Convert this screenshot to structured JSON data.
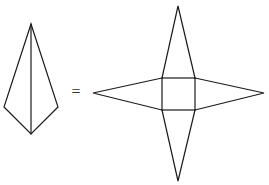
{
  "diagram": {
    "type": "pyramid-net-equivalence",
    "colors": {
      "background": "#ffffff",
      "stroke": "#1a1a1a"
    },
    "operator": "=",
    "pyramid": {
      "label": "square pyramid (3D view)",
      "apex": [
        31,
        24
      ],
      "left": [
        4,
        107
      ],
      "right": [
        58,
        107
      ],
      "bottom": [
        31,
        134
      ]
    },
    "net": {
      "label": "net of square pyramid",
      "square": {
        "x": 162,
        "y": 78,
        "width": 33,
        "height": 32
      },
      "triangles": [
        {
          "name": "top",
          "tip": [
            178,
            6
          ]
        },
        {
          "name": "left",
          "tip": [
            93,
            93
          ]
        },
        {
          "name": "right",
          "tip": [
            264,
            93
          ]
        },
        {
          "name": "bottom",
          "tip": [
            178,
            181
          ]
        }
      ]
    }
  }
}
